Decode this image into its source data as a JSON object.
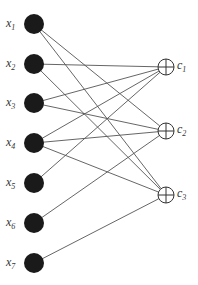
{
  "diagram": {
    "type": "bipartite-network",
    "inputs": [
      {
        "id": "x1",
        "label": "x",
        "sub": "1",
        "y": 24
      },
      {
        "id": "x2",
        "label": "x",
        "sub": "2",
        "y": 64
      },
      {
        "id": "x3",
        "label": "x",
        "sub": "3",
        "y": 103
      },
      {
        "id": "x4",
        "label": "x",
        "sub": "4",
        "y": 143
      },
      {
        "id": "x5",
        "label": "x",
        "sub": "5",
        "y": 183
      },
      {
        "id": "x6",
        "label": "x",
        "sub": "6",
        "y": 223
      },
      {
        "id": "x7",
        "label": "x",
        "sub": "7",
        "y": 263
      }
    ],
    "outputs": [
      {
        "id": "c1",
        "label": "c",
        "sub": "1",
        "y": 67
      },
      {
        "id": "c2",
        "label": "c",
        "sub": "2",
        "y": 131
      },
      {
        "id": "c3",
        "label": "c",
        "sub": "3",
        "y": 195
      }
    ],
    "edges": [
      [
        "x1",
        "c2"
      ],
      [
        "x1",
        "c3"
      ],
      [
        "x2",
        "c1"
      ],
      [
        "x2",
        "c3"
      ],
      [
        "x3",
        "c1"
      ],
      [
        "x3",
        "c2"
      ],
      [
        "x4",
        "c1"
      ],
      [
        "x4",
        "c2"
      ],
      [
        "x4",
        "c3"
      ],
      [
        "x5",
        "c1"
      ],
      [
        "x6",
        "c2"
      ],
      [
        "x7",
        "c3"
      ]
    ],
    "colors": {
      "input_fill": "#1a1a1a",
      "edge": "#555555",
      "sum_stroke": "#333333"
    }
  }
}
